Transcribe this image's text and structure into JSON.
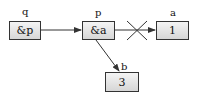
{
  "nodes": [
    {
      "id": "q",
      "label": "q",
      "value": "&p"
    },
    {
      "id": "p",
      "label": "p",
      "value": "&a"
    },
    {
      "id": "a",
      "label": "a",
      "value": "1"
    },
    {
      "id": "b",
      "label": "b",
      "value": "3"
    }
  ],
  "edges": [
    {
      "from": "q",
      "to": "p",
      "status": "active"
    },
    {
      "from": "p",
      "to": "a",
      "status": "removed"
    },
    {
      "from": "p",
      "to": "b",
      "status": "active"
    }
  ],
  "colors": {
    "stroke": "#333333",
    "box_fill_top": "#f4f4f4",
    "box_fill_bottom": "#d6d6d6"
  }
}
